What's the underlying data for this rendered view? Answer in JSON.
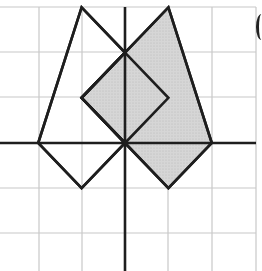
{
  "diagram": {
    "type": "coordinate-grid-with-polygons",
    "grid": {
      "x_lines_px": [
        39,
        82,
        125,
        168,
        212,
        256
      ],
      "y_lines_px": [
        7,
        52,
        97,
        143,
        188,
        233
      ],
      "line_color": "#c8c8c8",
      "origin_px": [
        125,
        143
      ],
      "unit_px": [
        43.4,
        45.2
      ]
    },
    "axes": {
      "color": "#1e1e1e",
      "x_axis": {
        "from_px": [
          0,
          143
        ],
        "to_px": [
          256,
          143
        ]
      },
      "y_axis": {
        "from_px": [
          125,
          7
        ],
        "to_px": [
          125,
          271
        ]
      }
    },
    "shapes": [
      {
        "name": "white-figure",
        "fill": "#ffffff",
        "stroke": "#1e1e1e",
        "vertices_units": [
          [
            -1,
            3
          ],
          [
            0,
            2
          ],
          [
            -1,
            1
          ],
          [
            0,
            0
          ],
          [
            -1,
            -1
          ],
          [
            -2,
            0
          ]
        ]
      },
      {
        "name": "shaded-figure",
        "fill": "#d4d4d4",
        "stroke": "#1e1e1e",
        "vertices_units": [
          [
            0,
            2
          ],
          [
            1,
            3
          ],
          [
            2,
            0
          ],
          [
            1,
            -1
          ],
          [
            0,
            0
          ],
          [
            -1,
            1
          ]
        ]
      }
    ],
    "inner_diamond_units": [
      [
        0,
        2
      ],
      [
        1,
        1
      ],
      [
        0,
        0
      ],
      [
        -1,
        1
      ]
    ],
    "edge_glyph": "("
  }
}
